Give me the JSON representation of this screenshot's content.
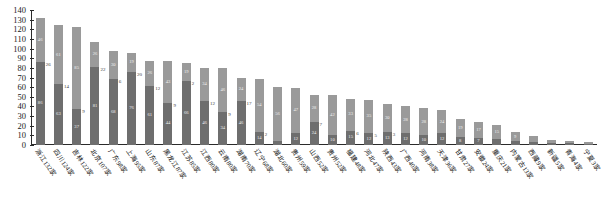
{
  "chart_data": {
    "type": "bar",
    "subtype": "stacked-bar",
    "title": "",
    "xlabel": "",
    "ylabel": "",
    "ylim": [
      0,
      140
    ],
    "ytick_step": 10,
    "yticks": [
      0,
      10,
      20,
      30,
      40,
      50,
      60,
      70,
      80,
      90,
      100,
      110,
      120,
      130,
      140
    ],
    "grid": false,
    "legend": "none",
    "series": [
      {
        "name": "series-bottom",
        "color": "#6e6e6e"
      },
      {
        "name": "series-top",
        "color": "#9a9a9a"
      }
    ],
    "categories": [
      "浙江132家",
      "四川124家",
      "吉林122家",
      "北京107家",
      "广东98家",
      "上海95家",
      "山东87家",
      "黑龙江87家",
      "江苏85家",
      "江西80家",
      "云南80家",
      "湖南70家",
      "辽宁68家",
      "湖北60家",
      "贵州59家",
      "山西52家",
      "贵州52家",
      "福建48家",
      "河北47家",
      "陕西43家",
      "广西40家",
      "河南38家",
      "天津36家",
      "甘肃27家",
      "安徽24家",
      "重庆21家",
      "内蒙古13家",
      "西藏9家",
      "新疆5家",
      "青海4家",
      "宁夏3家"
    ],
    "totals": [
      132,
      124,
      122,
      107,
      98,
      95,
      87,
      87,
      85,
      80,
      80,
      70,
      68,
      60,
      59,
      52,
      52,
      48,
      47,
      43,
      40,
      38,
      36,
      27,
      24,
      21,
      13,
      9,
      5,
      4,
      3
    ],
    "bars": [
      {
        "bottom": 86,
        "top": 46,
        "bottom_label": "86",
        "top_label": "46",
        "outer_label": "26"
      },
      {
        "bottom": 63,
        "top": 61,
        "bottom_label": "63",
        "top_label": "61",
        "outer_label": "14"
      },
      {
        "bottom": 37,
        "top": 85,
        "bottom_label": "37",
        "top_label": "85",
        "outer_label": "9"
      },
      {
        "bottom": 81,
        "top": 26,
        "bottom_label": "81",
        "top_label": "26",
        "outer_label": "22"
      },
      {
        "bottom": 68,
        "top": 30,
        "bottom_label": "68",
        "top_label": "30",
        "outer_label": "6"
      },
      {
        "bottom": 76,
        "top": 19,
        "bottom_label": "76",
        "top_label": "19",
        "outer_label": "20"
      },
      {
        "bottom": 61,
        "top": 26,
        "bottom_label": "61",
        "top_label": "26",
        "outer_label": "12"
      },
      {
        "bottom": 44,
        "top": 43,
        "bottom_label": "44",
        "top_label": "43",
        "outer_label": "9"
      },
      {
        "bottom": 66,
        "top": 19,
        "bottom_label": "66",
        "top_label": "19",
        "outer_label": "2"
      },
      {
        "bottom": 46,
        "top": 34,
        "bottom_label": "46",
        "top_label": "34",
        "outer_label": "12"
      },
      {
        "bottom": 34,
        "top": 46,
        "bottom_label": "34",
        "top_label": "46",
        "outer_label": "9"
      },
      {
        "bottom": 46,
        "top": 24,
        "bottom_label": "46",
        "top_label": "24",
        "outer_label": "17"
      },
      {
        "bottom": 14,
        "top": 54,
        "bottom_label": "14",
        "top_label": "54",
        "outer_label": "2"
      },
      {
        "bottom": 4,
        "top": 56,
        "bottom_label": "4",
        "top_label": "56",
        "outer_label": ""
      },
      {
        "bottom": 12,
        "top": 47,
        "bottom_label": "12",
        "top_label": "47",
        "outer_label": ""
      },
      {
        "bottom": 24,
        "top": 28,
        "bottom_label": "24",
        "top_label": "28",
        "outer_label": "7"
      },
      {
        "bottom": 10,
        "top": 42,
        "bottom_label": "10",
        "top_label": "42",
        "outer_label": ""
      },
      {
        "bottom": 15,
        "top": 33,
        "bottom_label": "15",
        "top_label": "33",
        "outer_label": "6"
      },
      {
        "bottom": 12,
        "top": 35,
        "bottom_label": "12",
        "top_label": "35",
        "outer_label": "5"
      },
      {
        "bottom": 13,
        "top": 30,
        "bottom_label": "13",
        "top_label": "30",
        "outer_label": "3"
      },
      {
        "bottom": 12,
        "top": 28,
        "bottom_label": "12",
        "top_label": "28",
        "outer_label": ""
      },
      {
        "bottom": 10,
        "top": 28,
        "bottom_label": "10",
        "top_label": "28",
        "outer_label": ""
      },
      {
        "bottom": 12,
        "top": 24,
        "bottom_label": "12",
        "top_label": "24",
        "outer_label": ""
      },
      {
        "bottom": 8,
        "top": 19,
        "bottom_label": "8",
        "top_label": "19",
        "outer_label": ""
      },
      {
        "bottom": 7,
        "top": 17,
        "bottom_label": "7",
        "top_label": "17",
        "outer_label": ""
      },
      {
        "bottom": 6,
        "top": 15,
        "bottom_label": "6",
        "top_label": "15",
        "outer_label": ""
      },
      {
        "bottom": 4,
        "top": 9,
        "bottom_label": "4",
        "top_label": "9",
        "outer_label": ""
      },
      {
        "bottom": 3,
        "top": 6,
        "bottom_label": "3",
        "top_label": "6",
        "outer_label": ""
      },
      {
        "bottom": 2,
        "top": 3,
        "bottom_label": "2",
        "top_label": "3",
        "outer_label": ""
      },
      {
        "bottom": 2,
        "top": 2,
        "bottom_label": "2",
        "top_label": "2",
        "outer_label": ""
      },
      {
        "bottom": 1,
        "top": 2,
        "bottom_label": "1",
        "top_label": "2",
        "outer_label": ""
      }
    ]
  }
}
